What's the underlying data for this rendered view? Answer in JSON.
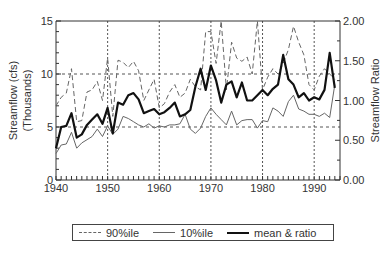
{
  "chart_data": {
    "type": "line",
    "title": "",
    "xlabel": "",
    "ylabel": "Streamflow (cfs) (Thousands)",
    "ylabel_line1": "Streamflow (cfs)",
    "ylabel_line2": "(Thousands)",
    "y2label": "Streamflow Ratio",
    "xlim": [
      1940,
      1995
    ],
    "ylim": [
      0,
      15
    ],
    "y2lim": [
      0,
      2.0
    ],
    "x_ticks": [
      "1940",
      "1950",
      "1960",
      "1970",
      "1980",
      "1990"
    ],
    "y_ticks": [
      "0",
      "5",
      "10",
      "15"
    ],
    "y2_ticks": [
      "0.00",
      "0.50",
      "1.00",
      "1.50",
      "2.00"
    ],
    "grid": "dashed at 10-yr intervals and y=5, y=10",
    "legend_position": "bottom",
    "x": [
      1940,
      1941,
      1942,
      1943,
      1944,
      1945,
      1946,
      1947,
      1948,
      1949,
      1950,
      1951,
      1952,
      1953,
      1954,
      1955,
      1956,
      1957,
      1958,
      1959,
      1960,
      1961,
      1962,
      1963,
      1964,
      1965,
      1966,
      1967,
      1968,
      1969,
      1970,
      1971,
      1972,
      1973,
      1974,
      1975,
      1976,
      1977,
      1978,
      1979,
      1980,
      1981,
      1982,
      1983,
      1984,
      1985,
      1986,
      1987,
      1988,
      1989,
      1990,
      1991,
      1992,
      1993,
      1994
    ],
    "series": [
      {
        "name": "90%ile",
        "style": "dashed",
        "values": [
          7.0,
          7.8,
          8.2,
          10.5,
          5.5,
          5.6,
          8.3,
          8.5,
          9.3,
          7.5,
          11.5,
          6.0,
          11.3,
          11.1,
          10.6,
          11.2,
          10.3,
          7.5,
          8.5,
          9.5,
          6.8,
          7.2,
          8.3,
          9.0,
          7.8,
          8.2,
          9.5,
          8.8,
          8.5,
          14.0,
          14.0,
          11.0,
          15.0,
          8.5,
          13.0,
          11.5,
          11.2,
          11.6,
          10.0,
          15.0,
          8.5,
          9.7,
          10.5,
          10.0,
          11.0,
          12.3,
          14.5,
          13.0,
          11.8,
          9.0,
          8.5,
          9.8,
          10.5,
          10.0,
          9.5
        ]
      },
      {
        "name": "10%ile",
        "style": "solid-thin",
        "values": [
          2.5,
          3.3,
          3.4,
          4.5,
          3.0,
          3.5,
          3.8,
          4.1,
          4.8,
          4.1,
          5.1,
          4.3,
          4.8,
          6.0,
          5.8,
          5.5,
          5.2,
          5.0,
          5.3,
          4.9,
          5.1,
          5.0,
          5.2,
          5.2,
          5.3,
          6.2,
          4.8,
          4.4,
          4.9,
          6.0,
          6.8,
          6.2,
          5.7,
          5.2,
          6.5,
          5.2,
          5.6,
          5.7,
          5.7,
          4.9,
          5.6,
          5.5,
          6.8,
          6.5,
          6.0,
          7.4,
          8.0,
          6.7,
          6.5,
          6.2,
          6.2,
          6.0,
          6.3,
          5.9,
          9.0
        ]
      },
      {
        "name": "mean & ratio",
        "style": "solid-bold",
        "values": [
          3.0,
          5.0,
          5.1,
          6.3,
          4.0,
          4.3,
          5.2,
          5.7,
          6.2,
          5.3,
          6.8,
          4.4,
          7.3,
          7.1,
          8.0,
          8.2,
          7.6,
          6.3,
          6.5,
          6.7,
          6.2,
          6.4,
          6.8,
          7.3,
          6.0,
          6.2,
          6.6,
          8.8,
          10.5,
          8.5,
          10.8,
          9.4,
          7.3,
          9.0,
          9.3,
          7.8,
          9.2,
          7.5,
          7.5,
          8.0,
          8.5,
          8.0,
          8.6,
          9.0,
          11.8,
          9.5,
          9.0,
          7.8,
          8.2,
          7.5,
          7.8,
          7.6,
          8.5,
          12.0,
          8.7
        ]
      }
    ]
  },
  "legend": {
    "items": [
      {
        "label": "90%ile"
      },
      {
        "label": "10%ile"
      },
      {
        "label": "mean & ratio"
      }
    ]
  }
}
